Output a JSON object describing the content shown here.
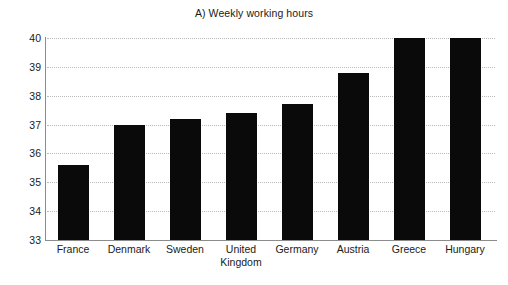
{
  "chart_data": {
    "type": "bar",
    "title": "A) Weekly working hours",
    "xlabel": "",
    "ylabel": "",
    "ylim": [
      33,
      40
    ],
    "yticks": [
      33,
      34,
      35,
      36,
      37,
      38,
      39,
      40
    ],
    "ytick_labels": [
      "33",
      "34",
      "35",
      "36",
      "37",
      "38",
      "39",
      "40"
    ],
    "grid": true,
    "grid_axis": "y",
    "grid_style": "dotted",
    "legend": false,
    "bar_color": "#0a0a0a",
    "categories": [
      "France",
      "Denmark",
      "Sweden",
      "United Kingdom",
      "Germany",
      "Austria",
      "Greece",
      "Hungary"
    ],
    "category_labels": [
      {
        "line1": "France",
        "line2": ""
      },
      {
        "line1": "Denmark",
        "line2": ""
      },
      {
        "line1": "Sweden",
        "line2": ""
      },
      {
        "line1": "United",
        "line2": "Kingdom"
      },
      {
        "line1": "Germany",
        "line2": ""
      },
      {
        "line1": "Austria",
        "line2": ""
      },
      {
        "line1": "Greece",
        "line2": ""
      },
      {
        "line1": "Hungary",
        "line2": ""
      }
    ],
    "values": [
      35.6,
      37.0,
      37.2,
      37.4,
      37.7,
      38.8,
      40.0,
      40.0
    ]
  }
}
